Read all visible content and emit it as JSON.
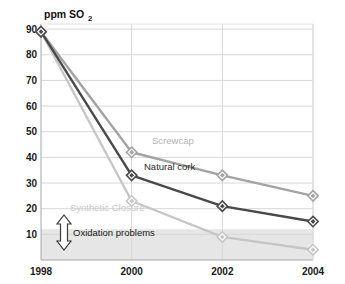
{
  "chart_data": {
    "type": "line",
    "title": "",
    "subtitle": "",
    "xlabel": "",
    "ylabel": "ppm SO2",
    "ylabel_main": "ppm SO",
    "ylabel_subscript": "2",
    "x": [
      1998,
      2000,
      2002,
      2004
    ],
    "categories": [
      "1998",
      "2000",
      "2002",
      "2004"
    ],
    "xtick_labels": [
      "1998",
      "2000",
      "2002",
      "2004"
    ],
    "ytick_labels": [
      "90",
      "80",
      "70",
      "60",
      "50",
      "40",
      "30",
      "20",
      "10"
    ],
    "ytick_values": [
      90,
      80,
      70,
      60,
      50,
      40,
      30,
      20,
      10
    ],
    "ylim": [
      0,
      92
    ],
    "xlim": [
      1998,
      2004
    ],
    "grid": true,
    "legend_position": "inline-labels",
    "series": [
      {
        "name": "Screwcap",
        "label": "Screwcap",
        "color": "#a3a3a3",
        "label_color": "#b4b4b4",
        "values": [
          89,
          42,
          33,
          25
        ]
      },
      {
        "name": "Natural cork",
        "label": "Natural cork",
        "color": "#4a4a4a",
        "label_color": "#2b2b2b",
        "values": [
          89,
          33,
          21,
          15
        ]
      },
      {
        "name": "Synthetic Closure",
        "label": "Synthetic Closure",
        "color": "#c6c6c6",
        "label_color": "#c9c9c9",
        "values": [
          89,
          23,
          9,
          4
        ]
      }
    ],
    "annotations": [
      {
        "name": "oxidation-problems",
        "text": "Oxidation problems",
        "icon": "double-arrow-vertical-icon",
        "band_upper_value": 12,
        "band_lower_value": 0,
        "band_color": "#e6e6e6"
      }
    ]
  },
  "colors": {
    "background": "#ffffff",
    "gridline": "#d8d8d8",
    "axis": "#9a9a9a",
    "plot_border": "#cfcfcf",
    "text": "#1a1a1a",
    "band": "#e6e6e6"
  }
}
